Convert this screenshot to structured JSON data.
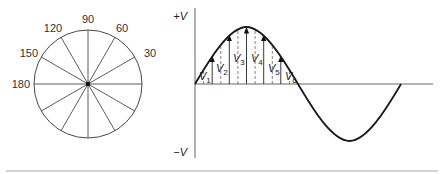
{
  "figure": {
    "phasor_circle": {
      "center": [
        88,
        84
      ],
      "radius": 54,
      "spoke_count": 12,
      "angle_labels": [
        {
          "text": "90",
          "angle": 90
        },
        {
          "text": "60",
          "angle": 60
        },
        {
          "text": "30",
          "angle": 30
        },
        {
          "text": "120",
          "angle": 120
        },
        {
          "text": "150",
          "angle": 150
        },
        {
          "text": "180",
          "angle": 180
        }
      ]
    },
    "waveform": {
      "axis_positive_label": "+V",
      "axis_negative_label": "−V",
      "instantaneous_labels": [
        {
          "main": "V",
          "sub": "1"
        },
        {
          "main": "V",
          "sub": "2"
        },
        {
          "main": "V",
          "sub": "3"
        },
        {
          "main": "V",
          "sub": "4"
        },
        {
          "main": "V",
          "sub": "5"
        },
        {
          "main": "V",
          "sub": "6"
        }
      ],
      "arrow_angles_deg": [
        30,
        60,
        90,
        120,
        150
      ],
      "dashed_angles_deg": [
        15,
        45,
        75,
        105,
        135,
        165
      ]
    },
    "colors": {
      "line": "#222222",
      "axis": "#555555",
      "rule": "#aaaaaa"
    }
  }
}
